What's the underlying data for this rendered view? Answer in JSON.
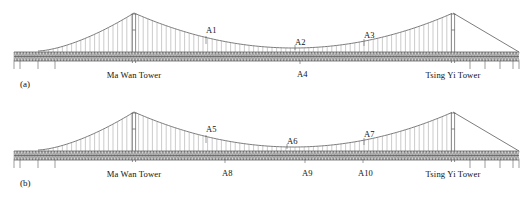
{
  "figure": {
    "panels": [
      {
        "tag": "(a)",
        "tag_x": 20,
        "tag_y": 80,
        "towers": [
          {
            "name": "Ma Wan Tower",
            "label_x": 134,
            "label_y": 71,
            "apex_x": 134,
            "apex_y": 13
          },
          {
            "name": "Tsing Yi Tower",
            "label_x": 453,
            "label_y": 71,
            "apex_x": 453,
            "apex_y": 13
          }
        ],
        "sensors": [
          {
            "id": "A1",
            "label_x": 206,
            "label_y": 26,
            "tick_x": 206,
            "tick_y1": 36,
            "tick_y2": 44,
            "side": "above"
          },
          {
            "id": "A2",
            "label_x": 295,
            "label_y": 38,
            "tick_x": 295,
            "tick_y1": 45,
            "tick_y2": 50,
            "side": "above"
          },
          {
            "id": "A3",
            "label_x": 364,
            "label_y": 31,
            "tick_x": 364,
            "tick_y1": 39,
            "tick_y2": 46,
            "side": "above"
          },
          {
            "id": "A4",
            "label_x": 297,
            "label_y": 70,
            "tick_x": 300,
            "tick_y1": 60,
            "tick_y2": 64,
            "side": "below"
          }
        ]
      },
      {
        "tag": "(b)",
        "tag_x": 20,
        "tag_y": 80,
        "towers": [
          {
            "name": "Ma Wan Tower",
            "label_x": 134,
            "label_y": 71,
            "apex_x": 134,
            "apex_y": 13
          },
          {
            "name": "Tsing Yi Tower",
            "label_x": 453,
            "label_y": 71,
            "apex_x": 453,
            "apex_y": 13
          }
        ],
        "sensors": [
          {
            "id": "A5",
            "label_x": 206,
            "label_y": 26,
            "tick_x": 206,
            "tick_y1": 36,
            "tick_y2": 44,
            "side": "above"
          },
          {
            "id": "A6",
            "label_x": 287,
            "label_y": 38,
            "tick_x": 287,
            "tick_y1": 45,
            "tick_y2": 50,
            "side": "above"
          },
          {
            "id": "A7",
            "label_x": 364,
            "label_y": 31,
            "tick_x": 364,
            "tick_y1": 39,
            "tick_y2": 46,
            "side": "above"
          },
          {
            "id": "A8",
            "label_x": 222,
            "label_y": 70,
            "tick_x": 225,
            "tick_y1": 60,
            "tick_y2": 64,
            "side": "below"
          },
          {
            "id": "A9",
            "label_x": 302,
            "label_y": 70,
            "tick_x": 305,
            "tick_y1": 60,
            "tick_y2": 64,
            "side": "below"
          },
          {
            "id": "A10",
            "label_x": 358,
            "label_y": 70,
            "tick_x": 363,
            "tick_y1": 60,
            "tick_y2": 64,
            "side": "below"
          }
        ]
      }
    ],
    "geometry": {
      "deck_top_y": 52,
      "deck_bottom_y": 61,
      "deck_left_x": 14,
      "deck_right_x": 519,
      "main_span_left_x": 134,
      "main_span_right_x": 453,
      "main_span_sag_y": 48,
      "side_span_left_anchor_x": 38,
      "side_span_left_anchor_y": 51,
      "backstay_right_anchor_x": 519,
      "backstay_right_anchor_y": 52,
      "hanger_spacing": 4.6,
      "pier_positions_left": [
        20,
        38,
        55
      ],
      "pier_positions_right": [
        470,
        485,
        500,
        513
      ],
      "pier_depth": 8
    },
    "colors": {
      "line": "#5a5a5a",
      "deck_fill": "#d8d8d8",
      "hanger": "#8a8a8a",
      "background": "#ffffff",
      "text": "#111111"
    }
  }
}
